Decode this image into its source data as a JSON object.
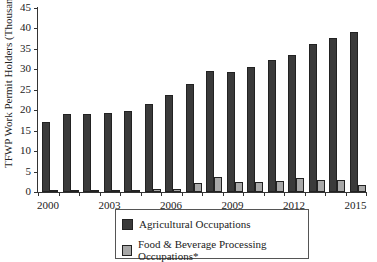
{
  "chart_data": {
    "type": "bar",
    "title": "",
    "xlabel": "",
    "ylabel": "TFWP Work Permit Holders (Thousands)",
    "ylim": [
      0,
      45
    ],
    "yticks": [
      0,
      5,
      10,
      15,
      20,
      25,
      30,
      35,
      40,
      45
    ],
    "categories": [
      "2000",
      "2001",
      "2002",
      "2003",
      "2004",
      "2005",
      "2006",
      "2007",
      "2008",
      "2009",
      "2010",
      "2011",
      "2012",
      "2013",
      "2014",
      "2015"
    ],
    "xtick_labels": [
      "2000",
      "2003",
      "2006",
      "2009",
      "2012",
      "2015"
    ],
    "series": [
      {
        "name": "Agricultural Occupations",
        "color": "#3a3a3a",
        "values": [
          17.2,
          19.1,
          19.1,
          19.3,
          19.7,
          21.5,
          23.8,
          26.5,
          29.6,
          29.3,
          30.5,
          32.3,
          33.4,
          36.1,
          37.6,
          39.2
        ]
      },
      {
        "name": "Food & Beverage Processing Occupations*",
        "color": "#a8a8a8",
        "values": [
          0.4,
          0.4,
          0.4,
          0.4,
          0.4,
          0.7,
          0.8,
          2.3,
          3.6,
          2.4,
          2.4,
          2.8,
          3.4,
          3.0,
          3.0,
          1.8
        ]
      }
    ],
    "grid": false,
    "legend_position": "bottom"
  },
  "legend": {
    "items": [
      "Agricultural Occupations",
      "Food & Beverage Processing Occupations*"
    ]
  }
}
